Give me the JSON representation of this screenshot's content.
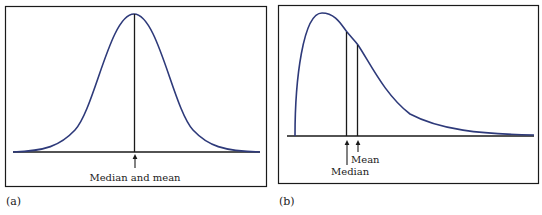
{
  "panels": [
    {
      "caption": "(a)",
      "shape": "symmetric bell curve",
      "labels": {
        "center": "Median and mean"
      }
    },
    {
      "caption": "(b)",
      "shape": "right-skewed curve",
      "labels": {
        "median": "Median",
        "mean": "Mean"
      }
    }
  ],
  "colors": {
    "curve": "#2e3a7a",
    "axis": "#1a1a1a",
    "frame": "#1a1a1a"
  }
}
